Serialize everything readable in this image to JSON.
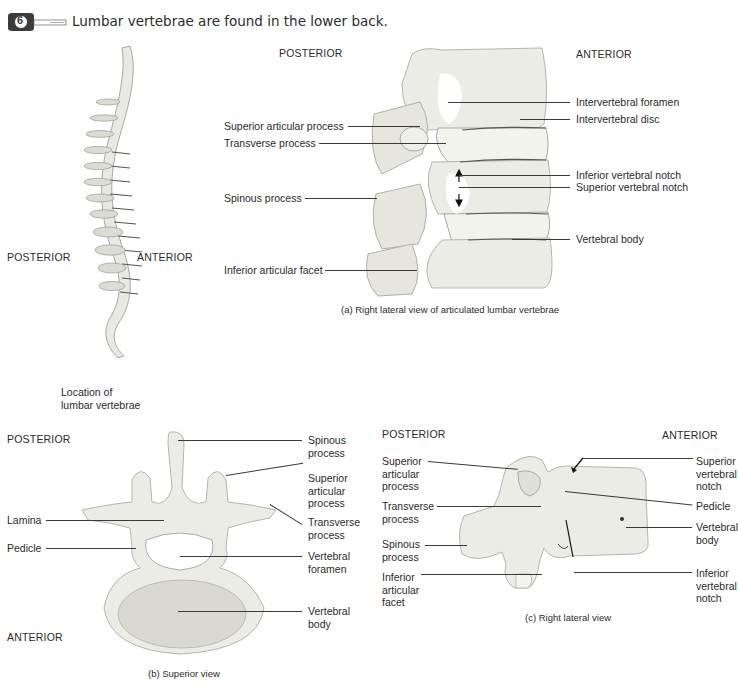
{
  "header": {
    "icon": "key-badge-icon",
    "icon_glyph": "6",
    "title": "Lumbar vertebrae are found in the lower back."
  },
  "spine_figure": {
    "posterior": "POSTERIOR",
    "anterior": "ANTERIOR",
    "caption_line1": "Location of",
    "caption_line2": "lumbar vertebrae"
  },
  "panel_a": {
    "posterior": "POSTERIOR",
    "anterior": "ANTERIOR",
    "labels_left": [
      "Superior articular process",
      "Transverse process",
      "Spinous process",
      "Inferior articular facet"
    ],
    "labels_right": [
      "Intervertebral foramen",
      "Intervertebral disc",
      "Inferior vertebral notch",
      "Superior vertebral notch",
      "Vertebral body"
    ],
    "caption": "(a)  Right lateral view of articulated lumbar vertebrae"
  },
  "panel_b": {
    "posterior": "POSTERIOR",
    "anterior": "ANTERIOR",
    "labels_left": [
      "Lamina",
      "Pedicle"
    ],
    "labels_right": [
      "Spinous process",
      "Superior articular process",
      "Transverse process",
      "Vertebral foramen",
      "Vertebral body"
    ],
    "caption": "(b) Superior view"
  },
  "panel_c": {
    "posterior": "POSTERIOR",
    "anterior": "ANTERIOR",
    "labels_left": [
      "Superior articular process",
      "Transverse process",
      "Spinous process",
      "Inferior articular facet"
    ],
    "labels_right": [
      "Superior vertebral notch",
      "Pedicle",
      "Vertebral body",
      "Inferior vertebral notch"
    ],
    "caption": "(c) Right lateral view"
  },
  "colors": {
    "bone_fill": "#ecece6",
    "bone_stroke": "#b9b9b2",
    "text": "#2a2a2a",
    "leader": "#3a3a3a",
    "icon_dark": "#3b3b3b"
  }
}
